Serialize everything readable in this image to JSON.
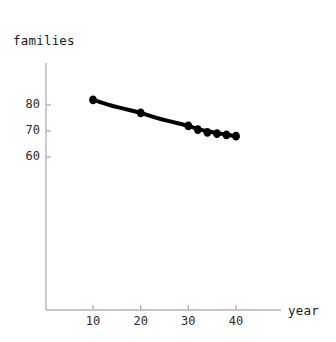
{
  "figure": {
    "width": 336,
    "height": 342,
    "background_color": "#ffffff",
    "curve_color": "#000000",
    "marker_color": "#000000",
    "axis_color": "#b4b4b4",
    "text_color": "#1a1a1a"
  },
  "labels": {
    "y_axis_label": "families",
    "x_axis_label": "year"
  },
  "ticks": {
    "y": [
      {
        "value": 80,
        "text": "80"
      },
      {
        "value": 70,
        "text": "70"
      },
      {
        "value": 60,
        "text": "60"
      }
    ],
    "x": [
      {
        "value": 10,
        "text": "10"
      },
      {
        "value": 20,
        "text": "20"
      },
      {
        "value": 30,
        "text": "30"
      },
      {
        "value": 40,
        "text": "40"
      }
    ]
  },
  "chart_data": {
    "type": "line",
    "title": "",
    "xlabel": "year",
    "ylabel": "families",
    "grid": false,
    "legend": "none",
    "xlim": [
      0,
      49
    ],
    "ylim": [
      48,
      92
    ],
    "x_ticks": [
      10,
      20,
      30,
      40
    ],
    "y_ticks": [
      60,
      70,
      80
    ],
    "series": [
      {
        "name": "families",
        "marker": "disk",
        "line_width_px": 4,
        "x": [
          10,
          20,
          30,
          32,
          34,
          36,
          38,
          40
        ],
        "y": [
          82,
          77,
          72,
          70.5,
          69.5,
          69,
          68.5,
          68
        ]
      }
    ],
    "fit_curve": {
      "description": "smooth decreasing curve through the data points",
      "x": [
        10,
        12,
        14,
        16,
        18,
        20,
        22,
        24,
        26,
        28,
        30,
        32,
        34,
        36,
        38,
        40
      ],
      "y": [
        82,
        80.8,
        79.7,
        78.8,
        77.9,
        77,
        75.8,
        74.7,
        73.8,
        72.9,
        72,
        70.8,
        69.9,
        69.2,
        68.6,
        68
      ]
    }
  }
}
